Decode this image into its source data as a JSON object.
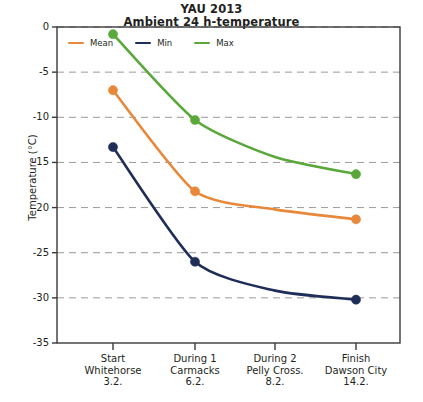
{
  "chart_data": {
    "type": "line",
    "title": "YAU 2013",
    "subtitle": "Ambient 24 h-temperature",
    "xlabel": "",
    "ylabel": "Temperature (°C)",
    "ylim": [
      -35,
      0
    ],
    "yticks": [
      0,
      -5,
      -10,
      -15,
      -20,
      -25,
      -30,
      -35
    ],
    "ytick_labels": [
      "0",
      "-5",
      "-10",
      "-15",
      "-20",
      "-25",
      "-30",
      "-35"
    ],
    "grid": true,
    "legend_position": "top-left-inside",
    "categories": [
      "Start",
      "During 1",
      "During 2",
      "Finish"
    ],
    "xtick_labels": [
      {
        "line1": "Start",
        "line2": "Whitehorse",
        "line3": "3.2."
      },
      {
        "line1": "During 1",
        "line2": "Carmacks",
        "line3": "6.2."
      },
      {
        "line1": "During 2",
        "line2": "Pelly Cross.",
        "line3": "8.2."
      },
      {
        "line1": "Finish",
        "line2": "Dawson City",
        "line3": "14.2."
      }
    ],
    "series": [
      {
        "name": "Mean",
        "color": "#E8883A",
        "values": [
          -7.0,
          -18.2,
          -20.2,
          -21.3
        ],
        "markers": [
          true,
          true,
          false,
          true
        ]
      },
      {
        "name": "Min",
        "color": "#1F2E58",
        "values": [
          -13.3,
          -26.0,
          -29.2,
          -30.2
        ],
        "markers": [
          true,
          true,
          false,
          true
        ]
      },
      {
        "name": "Max",
        "color": "#5AA83C",
        "values": [
          -0.8,
          -10.3,
          -14.4,
          -16.3
        ],
        "markers": [
          true,
          true,
          false,
          true
        ]
      }
    ]
  },
  "legend": {
    "items": [
      {
        "label": "Mean",
        "color": "#E8883A"
      },
      {
        "label": "Min",
        "color": "#1F2E58"
      },
      {
        "label": "Max",
        "color": "#5AA83C"
      }
    ]
  }
}
